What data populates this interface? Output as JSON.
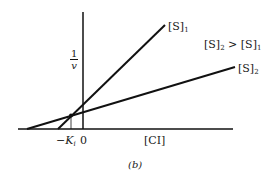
{
  "diagram": {
    "type": "Dixon plot",
    "y_axis_label_num": "1",
    "y_axis_label_den": "v",
    "x_axis_label": "[CI]",
    "origin_label": "0",
    "ki_label_prefix": "−K",
    "ki_label_sub": "i",
    "line1": {
      "label": "[S]",
      "sub": "1"
    },
    "line2": {
      "label": "[S]",
      "sub": "2"
    },
    "relation": {
      "a": "[S]",
      "a_sub": "2",
      "op": " > ",
      "b": "[S]",
      "b_sub": "1"
    },
    "caption": "(b)"
  }
}
